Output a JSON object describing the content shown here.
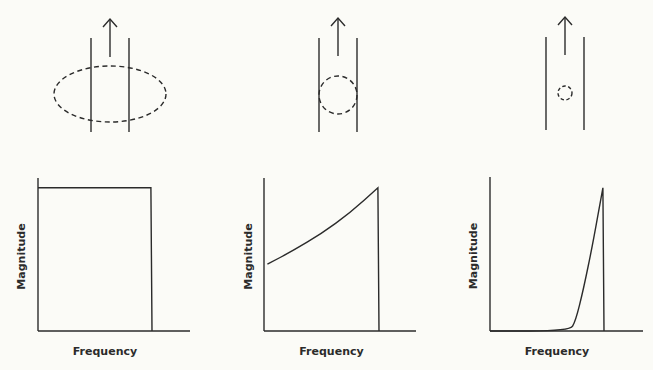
{
  "figure": {
    "colors": {
      "background": "#fbfbf7",
      "ink": "#2b2b2b"
    },
    "panels": [
      {
        "id": "panel-1",
        "top_diagram": {
          "elements": [
            "conductor-left-line",
            "conductor-right-line",
            "up-arrow",
            "dashed-field-loop"
          ],
          "loop_shape": "wide ellipse",
          "loop_relative_size": "large"
        },
        "graph": {
          "xlabel": "Frequency",
          "ylabel": "Magnitude",
          "shape": "flat",
          "description": "Constant magnitude across frequency up to a cutoff, then drops to zero"
        }
      },
      {
        "id": "panel-2",
        "top_diagram": {
          "elements": [
            "conductor-left-line",
            "conductor-right-line",
            "up-arrow",
            "dashed-field-loop"
          ],
          "loop_shape": "circle",
          "loop_relative_size": "medium"
        },
        "graph": {
          "xlabel": "Frequency",
          "ylabel": "Magnitude",
          "shape": "rising",
          "description": "Magnitude rises gradually with frequency up to the cutoff"
        }
      },
      {
        "id": "panel-3",
        "top_diagram": {
          "elements": [
            "conductor-left-line",
            "conductor-right-line",
            "up-arrow",
            "dashed-field-loop"
          ],
          "loop_shape": "circle",
          "loop_relative_size": "small"
        },
        "graph": {
          "xlabel": "Frequency",
          "ylabel": "Magnitude",
          "shape": "steep",
          "description": "Magnitude is zero at low frequency, then rises steeply near the cutoff"
        }
      }
    ]
  },
  "chart_data": [
    {
      "type": "line",
      "title": "",
      "xlabel": "Frequency",
      "ylabel": "Magnitude",
      "x": [
        0,
        0.99,
        1.0
      ],
      "y": [
        0.75,
        0.75,
        0
      ],
      "xlim": [
        0,
        1.3
      ],
      "ylim": [
        0,
        1
      ],
      "grid": false
    },
    {
      "type": "line",
      "title": "",
      "xlabel": "Frequency",
      "ylabel": "Magnitude",
      "x": [
        0.03,
        0.25,
        0.5,
        0.75,
        0.99,
        1.0
      ],
      "y": [
        0.35,
        0.42,
        0.51,
        0.62,
        0.75,
        0
      ],
      "xlim": [
        0,
        1.3
      ],
      "ylim": [
        0,
        1
      ],
      "grid": false
    },
    {
      "type": "line",
      "title": "",
      "xlabel": "Frequency",
      "ylabel": "Magnitude",
      "x": [
        0.0,
        0.7,
        0.75,
        0.82,
        0.9,
        0.99,
        1.0
      ],
      "y": [
        0,
        0,
        0.05,
        0.22,
        0.45,
        0.75,
        0
      ],
      "xlim": [
        0,
        1.3
      ],
      "ylim": [
        0,
        1
      ],
      "grid": false
    }
  ]
}
